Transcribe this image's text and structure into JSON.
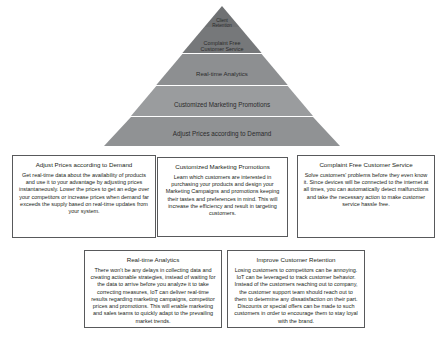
{
  "diagram": {
    "pyramid": {
      "colors": {
        "tier_top": "#6f7173",
        "tier_2": "#76787a",
        "tier_3": "#8d8f91",
        "tier_4": "#9a9c9e",
        "tier_5": "#909294",
        "divider": "#e9e9e9"
      },
      "tiers": [
        {
          "label": "Client\nRetention"
        },
        {
          "label": "Complaint Free\nCustomer Service"
        },
        {
          "label": "Real-time Analytics"
        },
        {
          "label": "Customized Marketing Promotions"
        },
        {
          "label": "Adjust Prices according to Demand"
        }
      ]
    },
    "boxes": [
      {
        "title": "Adjust Prices according to Demand",
        "body": "Get real-time data about the availability of products and use it to your advantage by adjusting prices instantaneously. Lower the prices to get an edge over your competitors or increase prices when demand far exceeds the supply based on real-time updates from your system."
      },
      {
        "title": "Customized Marketing Promotions",
        "body": "Learn which customers are interested in purchasing your products and design your Marketing Campaigns and promotions keeping their tastes and preferences in mind. This will increase the efficiency and result in targeting customers."
      },
      {
        "title": "Complaint Free Customer Service",
        "body": "Solve customers' problems before they even know it. Since devices will be connected to the internet at all times, you can automatically detect malfunctions and take the necessary action to make customer service hassle free."
      },
      {
        "title": "Real-time Analytics",
        "body": "There won't be any delays in collecting data and creating actionable strategies, instead of waiting for the data to arrive before you analyze it to take correcting measures, IoT can deliver real-time results regarding marketing campaigns, competitor prices and promotions. This will enable marketing and sales teams to quickly adapt to the prevailing market trends."
      },
      {
        "title": "Improve Customer Retention",
        "body": "Losing customers to competitors can be annoying. IoT can be leveraged to track customer behavior. Instead of the customers reaching out to company, the customer support team should reach out to them to determine any dissatisfaction on their part. Discounts or special offers can be made to such customers in order to encourage them to stay loyal with the brand."
      }
    ]
  }
}
